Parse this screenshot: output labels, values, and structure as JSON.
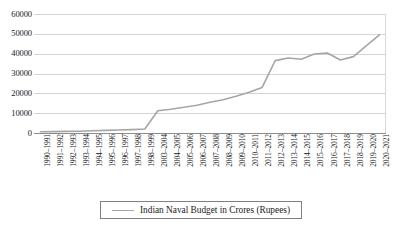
{
  "chart_data": {
    "type": "line",
    "title": "",
    "xlabel": "",
    "ylabel": "",
    "ylim": [
      0,
      60000
    ],
    "ytick_step": 10000,
    "grid": true,
    "legend_position": "bottom",
    "legend_entries": [
      "Indian Naval Budget in Crores (Rupees)"
    ],
    "series_color": "#a6a6a6",
    "categories": [
      "1990–1991",
      "1991–1992",
      "1992–1993",
      "1993–1994",
      "1994–1995",
      "1995–1996",
      "1996–1997",
      "1997–1998",
      "1998–1999",
      "2003–2004",
      "2004–2005",
      "2005–2006",
      "2006–2007",
      "2007–2008",
      "2008–2009",
      "2009–2010",
      "2010–2011",
      "2011–2012",
      "2012–2013",
      "2013–2014",
      "2014–2015",
      "2015–2016",
      "2016–2017",
      "2017–2018",
      "2018–2019",
      "2019–2020",
      "2020–2021"
    ],
    "series": [
      {
        "name": "Indian Naval Budget in Crores (Rupees)",
        "values": [
          600,
          700,
          800,
          900,
          1100,
          1300,
          1500,
          1700,
          2000,
          11200,
          12000,
          13000,
          14000,
          15500,
          16800,
          18500,
          20500,
          23000,
          36500,
          37800,
          37200,
          39800,
          40300,
          36800,
          38500,
          44000,
          49500
        ]
      }
    ],
    "ytick_labels": [
      "60000",
      "50000",
      "40000",
      "30000",
      "20000",
      "10000",
      "0"
    ]
  },
  "legend": {
    "label": "Indian Naval Budget in Crores (Rupees)"
  }
}
